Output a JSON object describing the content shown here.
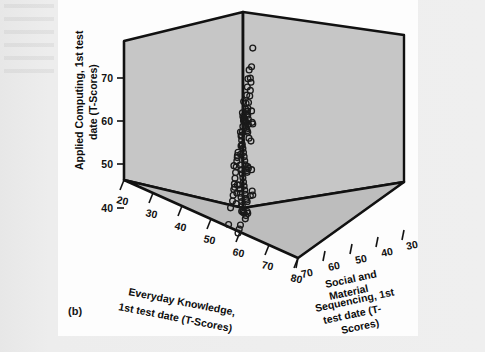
{
  "figure": {
    "panel_label": "(b)",
    "background_color": "#ececec",
    "panel_color": "#fdfdfd",
    "wall_color": "#c6c6c6",
    "floor_color": "#bdbdbd",
    "edge_color": "#111111",
    "marker_edge_color": "#1a1a1a",
    "marker_fill": "none"
  },
  "chart_data": {
    "type": "scatter",
    "projection": "3d",
    "title": "",
    "xlabel": "Everyday Knowledge, 1st test date (T-Scores)",
    "ylabel": "Applied Computing, 1st test date (T-Scores)",
    "zlabel": "Social and Material Sequencing, 1st test date (T-Scores)",
    "xlim": [
      20,
      80
    ],
    "ylim": [
      35,
      75
    ],
    "zlim": [
      30,
      70
    ],
    "xticks": [
      20,
      30,
      40,
      50,
      60,
      70,
      80
    ],
    "yticks": [
      40,
      50,
      60,
      70
    ],
    "zticks": [
      70,
      60,
      50,
      40,
      30
    ],
    "z_axis_reversed": true,
    "grid": false,
    "legend": null,
    "marker": "open-circle",
    "n_points": 112,
    "points": [
      [
        63,
        61.5,
        55
      ],
      [
        61,
        59.5,
        57
      ],
      [
        58,
        51.5,
        60
      ],
      [
        57,
        50.5,
        59
      ],
      [
        57,
        49.5,
        61
      ],
      [
        56,
        48.5,
        58
      ],
      [
        55,
        45.5,
        62
      ],
      [
        55,
        44.5,
        60
      ],
      [
        54,
        44.0,
        63
      ],
      [
        53,
        42.0,
        64
      ],
      [
        60,
        53.0,
        58
      ],
      [
        61,
        52.5,
        56
      ],
      [
        62,
        54.5,
        55
      ],
      [
        63,
        55.0,
        54
      ],
      [
        64,
        56.0,
        53
      ],
      [
        65,
        57.0,
        52
      ],
      [
        66,
        57.5,
        51
      ],
      [
        67,
        57.0,
        50
      ],
      [
        68,
        56.5,
        49
      ],
      [
        69,
        56.0,
        48
      ],
      [
        70,
        57.5,
        47
      ],
      [
        71,
        58.0,
        46
      ],
      [
        72,
        57.0,
        45
      ],
      [
        73,
        56.0,
        44
      ],
      [
        66,
        59.5,
        52
      ],
      [
        67,
        60.5,
        51
      ],
      [
        68,
        62.0,
        50
      ],
      [
        69,
        63.5,
        49
      ],
      [
        70,
        65.0,
        48
      ],
      [
        72,
        66.5,
        46
      ],
      [
        74,
        64.5,
        44
      ],
      [
        76,
        66.5,
        42
      ],
      [
        78,
        70.0,
        40
      ],
      [
        64,
        58.0,
        53
      ],
      [
        65,
        57.5,
        52
      ],
      [
        66,
        57.0,
        51
      ],
      [
        67,
        56.5,
        50
      ],
      [
        68,
        55.5,
        49
      ],
      [
        69,
        55.0,
        48
      ],
      [
        70,
        54.5,
        47
      ],
      [
        71,
        54.0,
        46
      ],
      [
        72,
        53.5,
        45
      ],
      [
        73,
        55.0,
        44
      ],
      [
        74,
        52.0,
        43
      ],
      [
        60,
        55.5,
        57
      ],
      [
        61,
        54.5,
        56
      ],
      [
        62,
        53.5,
        55
      ],
      [
        63,
        52.5,
        54
      ],
      [
        64,
        51.5,
        53
      ],
      [
        65,
        50.5,
        52
      ],
      [
        66,
        49.5,
        51
      ],
      [
        67,
        48.5,
        50
      ],
      [
        68,
        47.5,
        49
      ],
      [
        69,
        46.5,
        48
      ],
      [
        70,
        46.0,
        47
      ],
      [
        71,
        45.5,
        46
      ],
      [
        72,
        46.5,
        45
      ],
      [
        73,
        46.0,
        44
      ],
      [
        62,
        47.5,
        55
      ],
      [
        63,
        46.5,
        54
      ],
      [
        64,
        45.5,
        53
      ],
      [
        65,
        44.5,
        52
      ],
      [
        66,
        43.5,
        51
      ],
      [
        67,
        42.5,
        50
      ],
      [
        68,
        41.5,
        49
      ],
      [
        69,
        40.5,
        48
      ],
      [
        70,
        40.0,
        47
      ],
      [
        71,
        39.5,
        46
      ],
      [
        58,
        45.0,
        59
      ],
      [
        59,
        44.0,
        58
      ],
      [
        60,
        43.0,
        57
      ],
      [
        61,
        42.0,
        56
      ],
      [
        62,
        41.0,
        55
      ],
      [
        63,
        40.0,
        54
      ],
      [
        64,
        39.0,
        53
      ],
      [
        65,
        38.5,
        52
      ],
      [
        56,
        52.0,
        61
      ],
      [
        55,
        51.5,
        62
      ],
      [
        54,
        50.5,
        63
      ],
      [
        53,
        49.5,
        64
      ],
      [
        52,
        48.5,
        65
      ],
      [
        51,
        47.5,
        66
      ],
      [
        50,
        46.5,
        67
      ],
      [
        49,
        45.5,
        68
      ],
      [
        48,
        44.5,
        69
      ],
      [
        47,
        43.5,
        70
      ],
      [
        46,
        42.0,
        70
      ],
      [
        45,
        38.5,
        70
      ],
      [
        76,
        57.5,
        42
      ],
      [
        77,
        55.0,
        41
      ],
      [
        78,
        54.5,
        40
      ],
      [
        75,
        51.5,
        43
      ],
      [
        76,
        45.5,
        42
      ],
      [
        77,
        41.0,
        41
      ],
      [
        78,
        40.0,
        40
      ],
      [
        74,
        40.5,
        44
      ],
      [
        71,
        37.5,
        46
      ],
      [
        72,
        37.0,
        45
      ],
      [
        69,
        37.0,
        48
      ],
      [
        68,
        36.5,
        49
      ],
      [
        60,
        36.5,
        57
      ],
      [
        58,
        36.0,
        59
      ],
      [
        56,
        35.5,
        61
      ],
      [
        66,
        38.0,
        51
      ],
      [
        64,
        38.5,
        53
      ],
      [
        62,
        39.0,
        55
      ],
      [
        74,
        62.0,
        44
      ],
      [
        75,
        63.5,
        43
      ],
      [
        73,
        61.0,
        45
      ],
      [
        71,
        60.0,
        47
      ],
      [
        70,
        59.0,
        48
      ],
      [
        69,
        58.5,
        49
      ]
    ]
  },
  "axes": {
    "y_tick_labels": [
      "70",
      "60",
      "50",
      "40"
    ],
    "x_tick_labels": [
      "20",
      "30",
      "40",
      "50",
      "60",
      "70",
      "80"
    ],
    "z_tick_labels": [
      "70",
      "60",
      "50",
      "40",
      "30"
    ],
    "y_title_lines": [
      "Applied Computing, 1st test",
      "date (T-Scores)"
    ],
    "x_title_lines": [
      "Everyday Knowledge,",
      "1st test date (T-Scores)"
    ],
    "z_title_lines": [
      "Social and",
      "Material",
      "Sequencing, 1st",
      "test date (T-",
      "Scores)"
    ]
  }
}
